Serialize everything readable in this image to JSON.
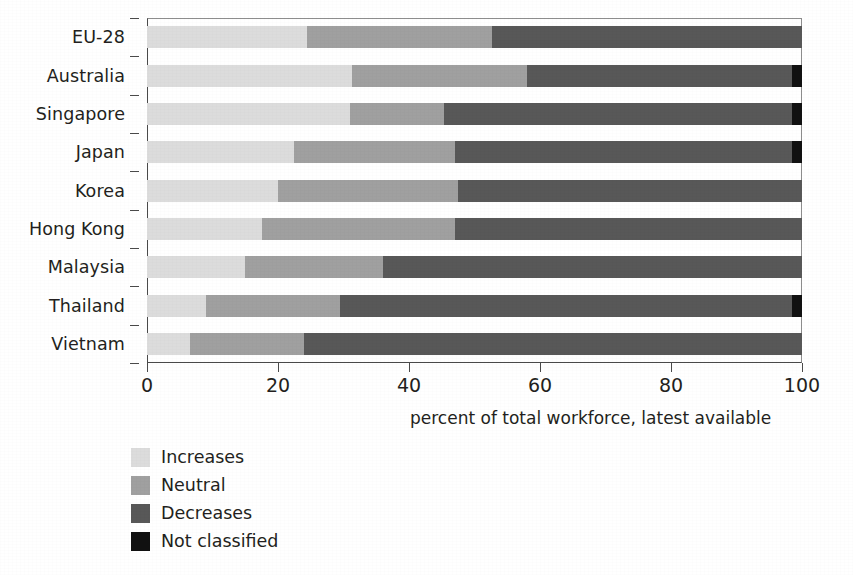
{
  "chart_data": {
    "type": "bar",
    "orientation": "horizontal",
    "stacked": true,
    "stack_mode": "percent",
    "title": "",
    "subtitle": "",
    "xlabel": "percent of total workforce, latest available",
    "ylabel": "",
    "xlim": [
      0,
      100
    ],
    "xticks": [
      0,
      20,
      40,
      60,
      80,
      100
    ],
    "xtick_labels": [
      "0",
      "20",
      "40",
      "60",
      "80",
      "100"
    ],
    "grid": false,
    "legend_position": "below-left",
    "categories": [
      "EU-28",
      "Australia",
      "Singapore",
      "Japan",
      "Korea",
      "Hong Kong",
      "Malaysia",
      "Thailand",
      "Vietnam"
    ],
    "series": [
      {
        "name": "Increases",
        "color": "#dcdcdc",
        "values": [
          24.4,
          31.3,
          31.0,
          22.5,
          20.0,
          17.5,
          15.0,
          9.0,
          6.5
        ]
      },
      {
        "name": "Neutral",
        "color": "#a0a0a0",
        "values": [
          28.3,
          26.7,
          14.3,
          24.5,
          27.5,
          29.5,
          21.0,
          20.5,
          17.5
        ]
      },
      {
        "name": "Decreases",
        "color": "#585858",
        "values": [
          47.3,
          40.5,
          53.2,
          51.5,
          52.5,
          53.0,
          64.0,
          69.0,
          76.0
        ]
      },
      {
        "name": "Not classified",
        "color": "#111111",
        "values": [
          0.0,
          1.5,
          1.5,
          1.5,
          0.0,
          0.0,
          0.0,
          1.5,
          0.0
        ]
      }
    ]
  },
  "legend": {
    "items": [
      {
        "label": "Increases",
        "color": "#dcdcdc"
      },
      {
        "label": "Neutral",
        "color": "#a0a0a0"
      },
      {
        "label": "Decreases",
        "color": "#585858"
      },
      {
        "label": "Not classified",
        "color": "#111111"
      }
    ]
  },
  "axis": {
    "x_title": "percent of total workforce, latest available"
  }
}
